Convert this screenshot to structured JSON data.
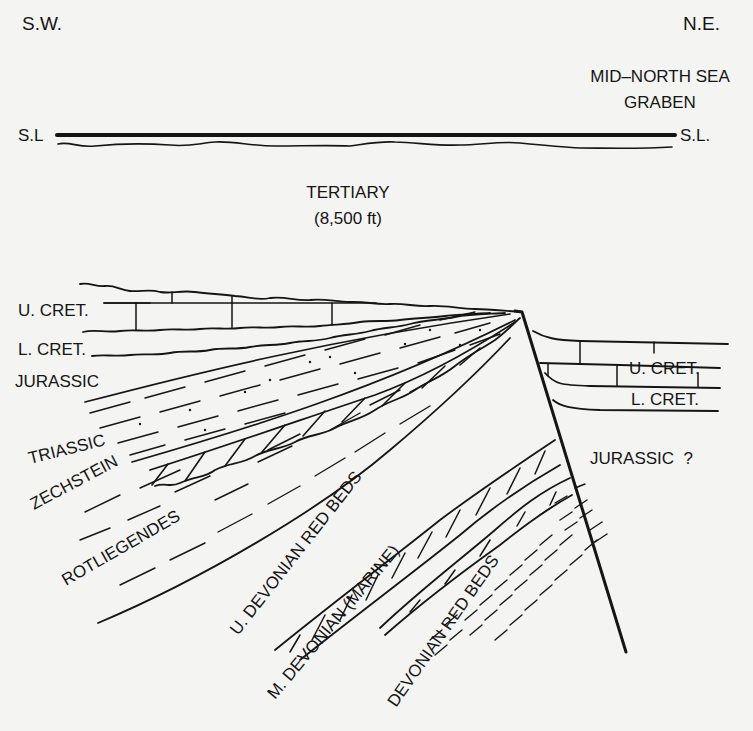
{
  "diagram": {
    "type": "geological-cross-section",
    "orientation": {
      "left": "S.W.",
      "right": "N.E."
    },
    "region_label": {
      "line1": "MID–NORTH SEA",
      "line2": "GRABEN"
    },
    "sea_level": {
      "left_label": "S.L",
      "right_label": "S.L."
    },
    "tertiary": {
      "name": "TERTIARY",
      "thickness": "(8,500 ft)"
    },
    "left_block_units": [
      {
        "id": "u-cret",
        "label": "U. CRET."
      },
      {
        "id": "l-cret",
        "label": "L. CRET."
      },
      {
        "id": "jurassic",
        "label": "JURASSIC"
      },
      {
        "id": "triassic",
        "label": "TRIASSIC"
      },
      {
        "id": "zechstein",
        "label": "ZECHSTEIN"
      },
      {
        "id": "rotliegendes",
        "label": "ROTLIEGENDES"
      },
      {
        "id": "u-devonian",
        "label": "U. DEVONIAN  RED  BEDS"
      },
      {
        "id": "m-devonian",
        "label": "M. DEVONIAN (MARINE)"
      },
      {
        "id": "devonian-red-beds",
        "label": "DEVONIAN RED BEDS"
      }
    ],
    "right_block_units": [
      {
        "id": "u-cret-right",
        "label": "U. CRET."
      },
      {
        "id": "l-cret-right",
        "label": "L. CRET."
      },
      {
        "id": "jurassic-right",
        "label": "JURASSIC  ?"
      }
    ]
  },
  "colors": {
    "background": "#f4f4f2",
    "ink": "#151515"
  }
}
